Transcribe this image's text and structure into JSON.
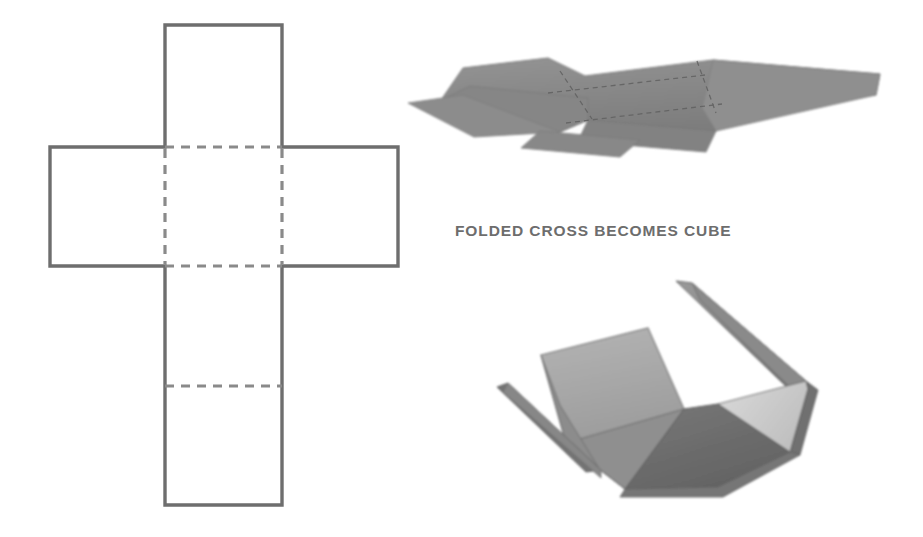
{
  "figure": {
    "background_color": "#ffffff",
    "width": 923,
    "height": 537
  },
  "caption": {
    "text": "FOLDED CROSS BECOMES CUBE",
    "color": "#6d6d6d",
    "x": 455,
    "y": 222
  },
  "colors": {
    "net_solid_line": "#6e6e6e",
    "net_dashed_line": "#8a8a8a",
    "net_fill": "#ffffff",
    "flat_cross_3d_fill": "#8a8a8a",
    "flat_cross_3d_fold": "#6b6b6b",
    "box_face_back": "#a9a9a9",
    "box_face_light": "#cfcfcf",
    "box_face_mid": "#9a9a9a",
    "box_face_dark": "#6e6e6e",
    "box_edge": "#5a5a5a"
  },
  "diagrams": [
    {
      "id": "cross-net-2d",
      "name": "Cross net flat pattern",
      "type": "line-drawing",
      "description": "Orthographic cross-shaped net of a cube drawn with solid outline and dashed fold lines",
      "panel_count": 6,
      "solid_outline": true,
      "fold_lines_style": "dashed",
      "bounds": {
        "x": 50,
        "y": 25,
        "width": 348,
        "height": 480
      },
      "grid": {
        "column_x": [
          50,
          165,
          282,
          398
        ],
        "row_y": [
          25,
          147,
          266,
          386,
          505
        ]
      },
      "panels": [
        {
          "name": "top-panel",
          "x": 165,
          "y": 25,
          "w": 117,
          "h": 122
        },
        {
          "name": "left-panel",
          "x": 50,
          "y": 147,
          "w": 115,
          "h": 119
        },
        {
          "name": "center-panel",
          "x": 165,
          "y": 147,
          "w": 117,
          "h": 119
        },
        {
          "name": "right-panel",
          "x": 282,
          "y": 147,
          "w": 116,
          "h": 119
        },
        {
          "name": "lower-middle-panel",
          "x": 165,
          "y": 266,
          "w": 117,
          "h": 120
        },
        {
          "name": "bottom-panel",
          "x": 165,
          "y": 386,
          "w": 117,
          "h": 119
        }
      ],
      "fold_lines": [
        {
          "name": "fold-top",
          "orientation": "horizontal",
          "x1": 165,
          "y1": 147,
          "x2": 282,
          "y2": 147
        },
        {
          "name": "fold-bottom",
          "orientation": "horizontal",
          "x1": 165,
          "y1": 266,
          "x2": 282,
          "y2": 266
        },
        {
          "name": "fold-lower",
          "orientation": "horizontal",
          "x1": 165,
          "y1": 386,
          "x2": 282,
          "y2": 386
        },
        {
          "name": "fold-left",
          "orientation": "vertical",
          "x1": 165,
          "y1": 147,
          "x2": 165,
          "y2": 266
        },
        {
          "name": "fold-right",
          "orientation": "vertical",
          "x1": 282,
          "y1": 147,
          "x2": 282,
          "y2": 266
        }
      ]
    },
    {
      "id": "flat-cross-3d",
      "name": "Flat cross in perspective",
      "type": "shaded-solid",
      "description": "The same cross net rendered as a flat gray sheet seen in oblique perspective with dashed crease lines",
      "bounds": {
        "x": 408,
        "y": 52,
        "width": 475,
        "height": 105
      },
      "fill": "#8a8a8a",
      "fold_lines_style": "dashed"
    },
    {
      "id": "partially-folded-box",
      "name": "Partially folded box",
      "type": "shaded-solid",
      "description": "Open cube with four side flaps folded upward, shown with light and dark shaded faces",
      "bounds": {
        "x": 480,
        "y": 278,
        "width": 350,
        "height": 225
      },
      "faces": [
        {
          "name": "back-face",
          "shade": "#a9a9a9"
        },
        {
          "name": "right-face",
          "shade": "#cfcfcf"
        },
        {
          "name": "floor-face",
          "shade": "#9a9a9a"
        },
        {
          "name": "front-face",
          "shade": "#6e6e6e"
        },
        {
          "name": "left-flap",
          "shade": "#6e6e6e"
        },
        {
          "name": "upper-flap",
          "shade": "#8d8d8d"
        }
      ]
    }
  ]
}
